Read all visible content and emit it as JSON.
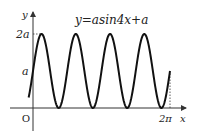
{
  "chart_data": {
    "type": "line",
    "title": "y=asin4x+a",
    "xlabel": "x",
    "ylabel": "y",
    "origin_label": "O",
    "x_ticks": [
      {
        "value": 6.283185,
        "label": "2π"
      }
    ],
    "y_ticks": [
      {
        "value": 1,
        "label": "a"
      },
      {
        "value": 2,
        "label": "2a"
      }
    ],
    "xlim": [
      -0.35,
      6.9
    ],
    "ylim": [
      -0.35,
      2.6
    ],
    "grid": false,
    "series": [
      {
        "name": "y=asin4x+a",
        "function": "a*sin(4x)+a",
        "a": 1,
        "x_range": [
          -0.2,
          6.283185
        ],
        "color": "#111111"
      }
    ],
    "guides": [
      {
        "type": "horizontal-dashed",
        "at_y": 2,
        "label": "2a"
      },
      {
        "type": "vertical-dashed",
        "at_x": 6.283185,
        "label": "2π"
      }
    ]
  }
}
